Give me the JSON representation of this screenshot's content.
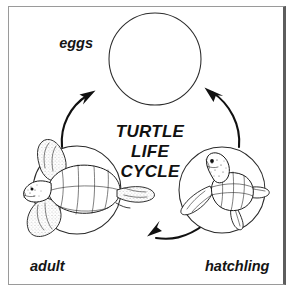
{
  "figure": {
    "title_lines": [
      "TURTLE",
      "LIFE",
      "CYCLE"
    ],
    "title_line1": "TURTLE",
    "title_line2": "LIFE",
    "title_line3": "CYCLE",
    "alt": "Turtle life cycle diagram with three stages connected by arrows"
  },
  "stages": [
    {
      "id": "eggs",
      "label": "eggs",
      "illustration": "nest-cross-section-with-eggs",
      "position": "top"
    },
    {
      "id": "hatchling",
      "label": "hatchling",
      "illustration": "hatchling-turtle",
      "position": "bottom-right"
    },
    {
      "id": "adult",
      "label": "adult",
      "illustration": "adult-sea-turtle",
      "position": "bottom-left"
    }
  ],
  "arrows": [
    {
      "id": "adult-to-eggs",
      "from": "adult",
      "to": "eggs",
      "direction": "up-right"
    },
    {
      "id": "eggs-to-hatchling",
      "from": "eggs",
      "to": "hatchling",
      "direction": "down-right"
    },
    {
      "id": "hatchling-to-adult",
      "from": "hatchling",
      "to": "adult",
      "direction": "left"
    }
  ],
  "colors": {
    "ink": "#111111",
    "background": "#ffffff",
    "frame": "#9a9a9a",
    "frame_right": "#5d5d5d"
  }
}
